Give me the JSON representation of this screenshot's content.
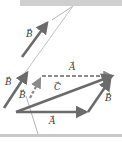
{
  "diagram": {
    "colors": {
      "vector": "#6b6b6b",
      "dashed_vector": "#8a8a8a",
      "surface": "#c9c9c9",
      "string": "#b5b5b5",
      "label": "#3a3a3a"
    },
    "labels": {
      "A_bottom": "A",
      "A_top": "A",
      "A_dashed": "A",
      "B_left": "B",
      "B_right": "B",
      "B_dashed": "B",
      "B_top": "B",
      "C": "C",
      "arrow_mark": "→"
    }
  }
}
